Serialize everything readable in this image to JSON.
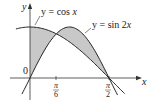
{
  "figure": {
    "curves": [
      {
        "label": "y = cos x",
        "prefix": "y = cos ",
        "var": "x"
      },
      {
        "label": "y = sin 2x",
        "prefix": "y = sin 2",
        "var": "x"
      }
    ],
    "axes": {
      "x_label": "x",
      "y_label": "y",
      "origin_label": "0"
    },
    "ticks": [
      {
        "num": "π",
        "den": "6"
      },
      {
        "num": "π",
        "den": "2"
      }
    ],
    "colors": {
      "shade": "#c8c8c8",
      "line": "#222222",
      "axis": "#333333"
    }
  },
  "chart_data": {
    "type": "line",
    "title": "",
    "xlabel": "x",
    "ylabel": "y",
    "series": [
      {
        "name": "y = cos x",
        "x": [
          -0.28,
          0,
          0.5236,
          0.7854,
          1.5708,
          1.85
        ],
        "values": [
          0.96,
          1,
          0.866,
          0.707,
          0,
          -0.28
        ]
      },
      {
        "name": "y = sin 2x",
        "x": [
          -0.16,
          0,
          0.5236,
          0.7854,
          1.5708,
          1.72
        ],
        "values": [
          -0.31,
          0,
          0.866,
          1,
          0,
          -0.3
        ]
      }
    ],
    "shaded_regions": [
      "between curves from 0 to π/6",
      "between curves from π/6 to π/2"
    ],
    "x_ticks": [
      "π/6",
      "π/2"
    ],
    "annotations": [
      "0"
    ],
    "grid": false
  }
}
